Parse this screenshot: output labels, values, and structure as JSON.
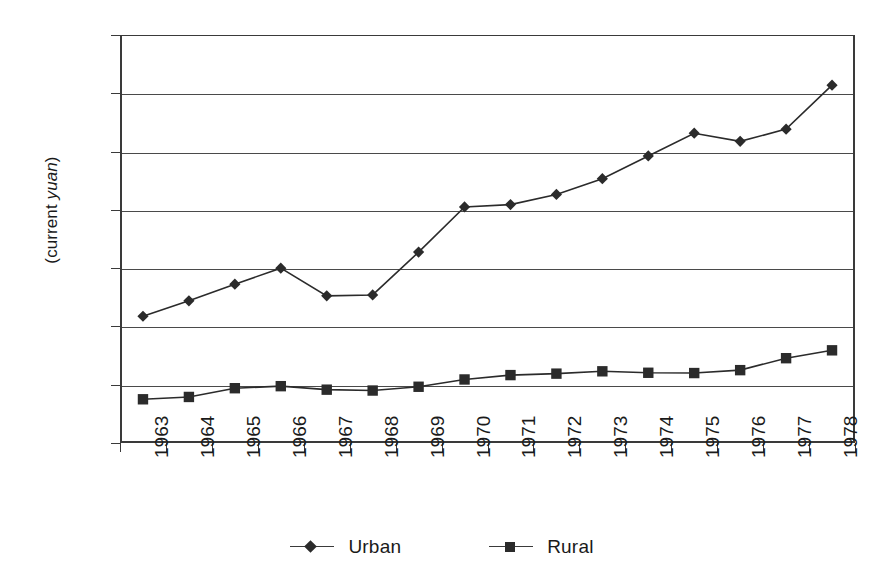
{
  "chart_data": {
    "type": "line",
    "title": "",
    "subtitle": "",
    "xlabel": "",
    "ylabel": "(current yuan)",
    "ylabel_plain": "(current ",
    "ylabel_italic": "yuan",
    "ylabel_tail": ")",
    "categories": [
      "1963",
      "1964",
      "1965",
      "1966",
      "1967",
      "1968",
      "1969",
      "1970",
      "1971",
      "1972",
      "1973",
      "1974",
      "1975",
      "1976",
      "1977",
      "1978"
    ],
    "ylim": [
      0,
      1400
    ],
    "ytick_values": [
      1400,
      1200,
      1000,
      800,
      600,
      400,
      200,
      0
    ],
    "ytick_labels": [
      "1400",
      "1200",
      "1000",
      "800",
      "600",
      "400",
      "200",
      "0"
    ],
    "grid": true,
    "grid_axis": "y",
    "legend_position": "bottom",
    "series": [
      {
        "name": "Urban",
        "marker": "diamond",
        "color": "#2b2b2b",
        "values": [
          435,
          488,
          545,
          600,
          505,
          508,
          655,
          810,
          818,
          853,
          907,
          985,
          1063,
          1035,
          1077,
          1228
        ]
      },
      {
        "name": "Rural",
        "marker": "square",
        "color": "#2b2b2b",
        "values": [
          150,
          158,
          188,
          195,
          183,
          180,
          193,
          218,
          233,
          238,
          246,
          241,
          240,
          250,
          291,
          318
        ]
      }
    ]
  },
  "legend": {
    "items": [
      {
        "label": "Urban",
        "marker": "diamond-marker-icon"
      },
      {
        "label": "Rural",
        "marker": "square-marker-icon"
      }
    ]
  },
  "colors": {
    "axis": "#3a3a3a",
    "grid": "#4a4a4a",
    "series": "#2b2b2b",
    "background": "#ffffff"
  }
}
